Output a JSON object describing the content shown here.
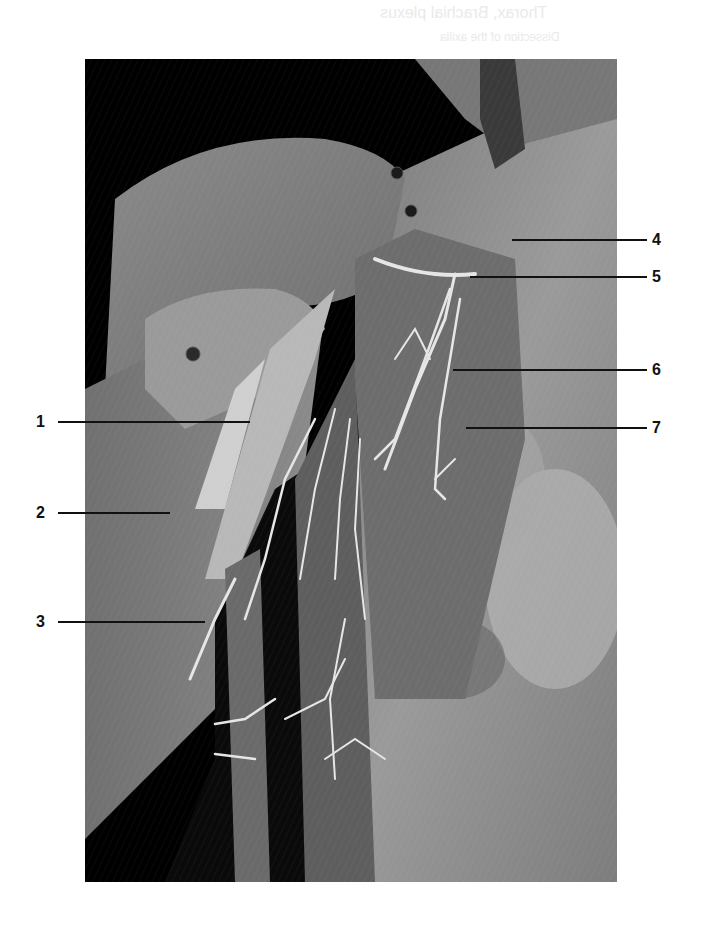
{
  "figure": {
    "type": "anatomical-photograph",
    "background": "#ffffff",
    "photo_tone": "grayscale",
    "bleed_through_text": [
      "Thorax, Brachial plexus",
      "Dissection of the axilla"
    ]
  },
  "labels": {
    "left": [
      {
        "id": "1",
        "text": "1",
        "y": 422,
        "line_end_x": 250
      },
      {
        "id": "2",
        "text": "2",
        "y": 513,
        "line_end_x": 170
      },
      {
        "id": "3",
        "text": "3",
        "y": 622,
        "line_end_x": 205
      }
    ],
    "right": [
      {
        "id": "4",
        "text": "4",
        "y": 240,
        "line_start_x": 512
      },
      {
        "id": "5",
        "text": "5",
        "y": 277,
        "line_start_x": 470
      },
      {
        "id": "6",
        "text": "6",
        "y": 370,
        "line_start_x": 453
      },
      {
        "id": "7",
        "text": "7",
        "y": 428,
        "line_start_x": 466
      }
    ]
  },
  "pins": [
    {
      "x": 397,
      "y": 173
    },
    {
      "x": 411,
      "y": 211
    },
    {
      "x": 193,
      "y": 354
    }
  ]
}
